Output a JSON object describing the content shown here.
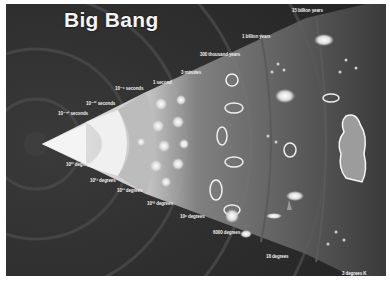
{
  "title": "Big Bang",
  "time_labels": [
    {
      "text": "10⁻⁴³ seconds",
      "x": 58,
      "y": 112
    },
    {
      "text": "10⁻³² seconds",
      "x": 80,
      "y": 91
    },
    {
      "text": "10⁻⁶ seconds",
      "x": 109,
      "y": 79
    },
    {
      "text": "1 second",
      "x": 147,
      "y": 78
    },
    {
      "text": "3 minutes",
      "x": 174,
      "y": 64
    },
    {
      "text": "300 thousand years",
      "x": 195,
      "y": 46
    },
    {
      "text": "1 billion years",
      "x": 236,
      "y": 28
    },
    {
      "text": "15 billion years",
      "x": 286,
      "y": 4
    }
  ],
  "temperature_labels": [
    {
      "text": "10³² degrees",
      "x": 59,
      "y": 159
    },
    {
      "text": "10²⁷ degrees",
      "x": 82,
      "y": 172
    },
    {
      "text": "10¹³ degrees",
      "x": 111,
      "y": 184
    },
    {
      "text": "10¹⁰ degrees",
      "x": 141,
      "y": 197
    },
    {
      "text": "10⁹ degrees",
      "x": 174,
      "y": 210
    },
    {
      "text": "6000 degrees",
      "x": 207,
      "y": 226
    },
    {
      "text": "18 degrees",
      "x": 261,
      "y": 250
    },
    {
      "text": "3 degrees K",
      "x": 336,
      "y": 271
    }
  ],
  "figures": {
    "thinker_statue": "The Thinker silhouette",
    "cone": "expanding universe cone"
  }
}
